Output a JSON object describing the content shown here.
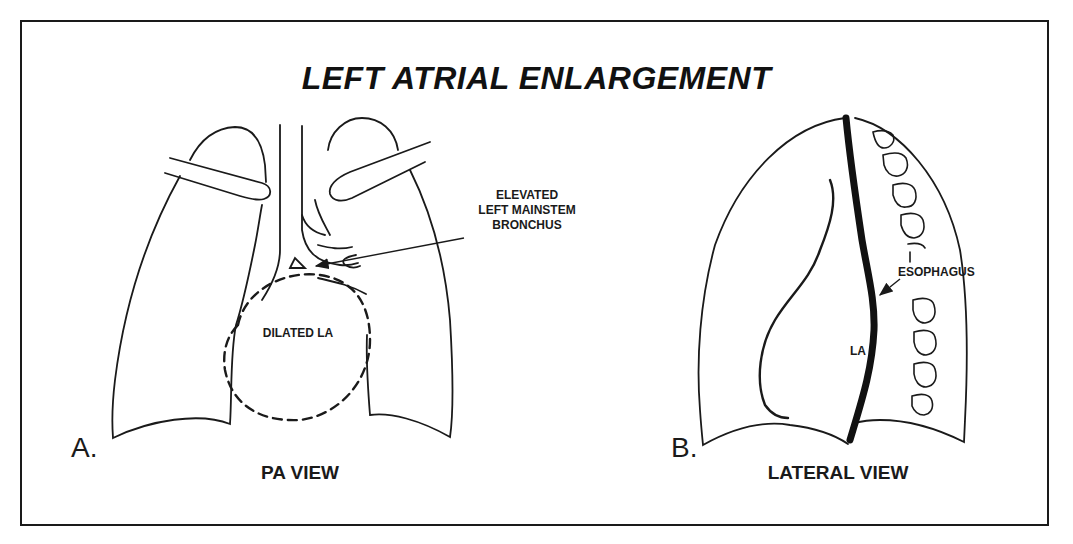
{
  "figure": {
    "title": "LEFT ATRIAL ENLARGEMENT",
    "panels": [
      {
        "letter": "A.",
        "view_label": "PA VIEW",
        "annotations": {
          "bronchus_label_line1": "ELEVATED",
          "bronchus_label_line2": "LEFT MAINSTEM",
          "bronchus_label_line3": "BRONCHUS",
          "atrium_label": "DILATED LA"
        }
      },
      {
        "letter": "B.",
        "view_label": "LATERAL VIEW",
        "annotations": {
          "esophagus_label": "ESOPHAGUS",
          "atrium_label": "LA"
        }
      }
    ]
  },
  "colors": {
    "line": "#1a1a1a",
    "background": "#ffffff",
    "frame": "#1a1a1a"
  }
}
